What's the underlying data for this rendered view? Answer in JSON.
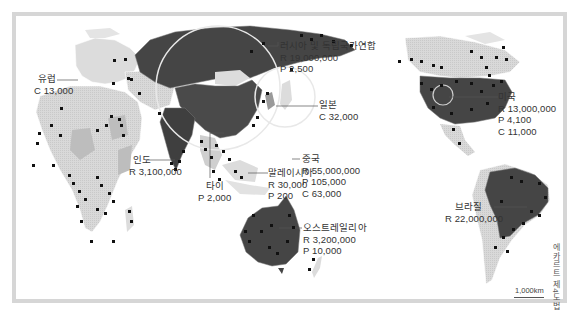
{
  "map": {
    "projection_note": "에카르트 제4도법",
    "scale_label": "1,000km",
    "colors": {
      "frame": "#d6d6d6",
      "background": "#ffffff",
      "ocean": "#ffffff",
      "land_light": "#dcdcdc",
      "land_medium": "#bdbdbd",
      "land_dark": "#4a4a4a",
      "highlight_dark": "#3d3d3d",
      "marker": "#111111",
      "circle": "#e6e6e6",
      "leader_line": "#555555"
    },
    "legend_prefix": {
      "R": "R",
      "P": "P",
      "C": "C"
    },
    "regions": [
      {
        "id": "europe",
        "name": "유럽",
        "values": [
          "C 13,000"
        ]
      },
      {
        "id": "russia",
        "name": "러시아 및 독립국가연합",
        "values": [
          "R 19,000,000",
          "P 2,500"
        ]
      },
      {
        "id": "japan",
        "name": "일본",
        "values": [
          "C 32,000"
        ]
      },
      {
        "id": "india",
        "name": "인도",
        "values": [
          "R 3,100,000"
        ]
      },
      {
        "id": "china",
        "name": "중국",
        "values": [
          "R 55,000,000",
          "P 105,000",
          "C 63,000"
        ]
      },
      {
        "id": "thailand",
        "name": "타이",
        "values": [
          "P 2,000"
        ]
      },
      {
        "id": "malaysia",
        "name": "말레이시아",
        "values": [
          "R 30,000",
          "P 200"
        ]
      },
      {
        "id": "australia",
        "name": "오스트레일리아",
        "values": [
          "R 3,200,000",
          "P 10,000"
        ]
      },
      {
        "id": "usa",
        "name": "미국",
        "values": [
          "R 13,000,000",
          "P 4,100",
          "C 11,000"
        ]
      },
      {
        "id": "brazil",
        "name": "브라질",
        "values": [
          "R 22,000,000"
        ]
      }
    ]
  }
}
